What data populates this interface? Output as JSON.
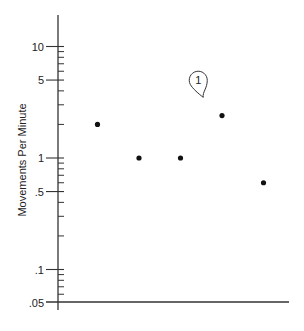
{
  "chart_data": {
    "type": "scatter",
    "title": "",
    "xlabel": "",
    "ylabel": "Movements Per Minute",
    "yscale": "log",
    "ylim": [
      0.05,
      15
    ],
    "grid": false,
    "legend": null,
    "yticks": [
      {
        "value": 10,
        "label": "10"
      },
      {
        "value": 5,
        "label": "5"
      },
      {
        "value": 1,
        "label": "1"
      },
      {
        "value": 0.5,
        "label": ".5"
      },
      {
        "value": 0.1,
        "label": ".1"
      },
      {
        "value": 0.05,
        "label": ".05"
      }
    ],
    "yminor_ticks": [
      9,
      8,
      7,
      6,
      4,
      3,
      2,
      0.9,
      0.8,
      0.7,
      0.6,
      0.4,
      0.3,
      0.2,
      0.09,
      0.08,
      0.07,
      0.06
    ],
    "x": [
      1,
      2,
      3,
      4,
      5
    ],
    "xlim": [
      0,
      5.8
    ],
    "series": [
      {
        "name": "observations",
        "values": [
          2.0,
          1.0,
          1.0,
          2.4,
          0.6
        ]
      }
    ],
    "annotations": [
      {
        "text": "1",
        "type": "callout",
        "points_to_x": 3.5,
        "points_to_y": 3.5
      }
    ]
  }
}
